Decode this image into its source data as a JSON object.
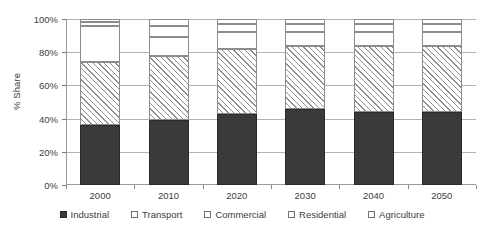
{
  "chart_data": {
    "type": "bar",
    "subtype": "stacked-bar-100",
    "title": "",
    "xlabel": "",
    "ylabel": "% Share",
    "ylim": [
      0,
      100
    ],
    "yticks": [
      0,
      20,
      40,
      60,
      80,
      100
    ],
    "ytick_labels": [
      "0%",
      "20%",
      "40%",
      "60%",
      "80%",
      "100%"
    ],
    "grid": true,
    "legend_position": "bottom",
    "categories": [
      "2000",
      "2010",
      "2020",
      "2030",
      "2040",
      "2050"
    ],
    "series": [
      {
        "name": "Industrial",
        "pattern": "solid-dark",
        "values": [
          36,
          39,
          43,
          46,
          44,
          44
        ]
      },
      {
        "name": "Transport",
        "pattern": "diagonal-hatch",
        "values": [
          38,
          39,
          39,
          38,
          40,
          40
        ]
      },
      {
        "name": "Commercial",
        "pattern": "blank",
        "values": [
          22,
          11,
          10,
          8,
          8,
          8
        ]
      },
      {
        "name": "Residential",
        "pattern": "blank",
        "values": [
          2,
          7,
          5,
          5,
          5,
          5
        ]
      },
      {
        "name": "Agriculture",
        "pattern": "blank",
        "values": [
          2,
          4,
          3,
          3,
          3,
          3
        ]
      }
    ]
  },
  "colors": {
    "industrial": "#3a3a3a",
    "hatch": "#8f8f8f",
    "blank": "#ffffff",
    "axis": "#9a9a9a",
    "grid": "#b4b4b4",
    "text": "#3d3d3d"
  }
}
